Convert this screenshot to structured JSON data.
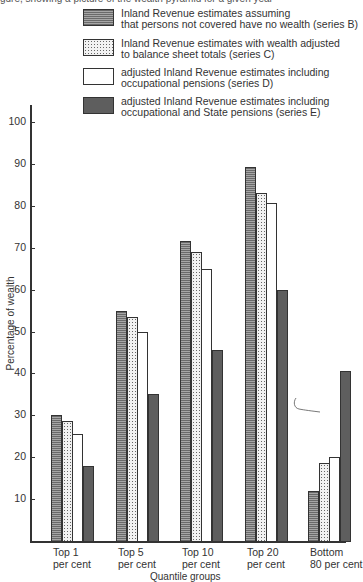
{
  "page": {
    "cut_caption": "gure, showing a picture of the wealth pyramid for a given year"
  },
  "chart_data": {
    "type": "bar",
    "title": "",
    "xlabel": "Quantile groups",
    "ylabel": "Percentage of wealth",
    "ylim": [
      0,
      100
    ],
    "yticks": [
      10,
      20,
      30,
      40,
      50,
      60,
      70,
      80,
      90,
      100
    ],
    "grid": false,
    "legend_position": "top-right",
    "categories": [
      "Top 1 per cent",
      "Top 5 per cent",
      "Top 10 per cent",
      "Top 20 per cent",
      "Bottom 80 per cent"
    ],
    "category_labels": [
      {
        "line1": "Top 1",
        "line2": "per cent"
      },
      {
        "line1": "Top 5",
        "line2": "per cent"
      },
      {
        "line1": "Top 10",
        "line2": "per cent"
      },
      {
        "line1": "Top 20",
        "line2": "per cent"
      },
      {
        "line1": "Bottom",
        "line2": "80 per cent"
      }
    ],
    "series": [
      {
        "name": "Inland Revenue estimates assuming that persons not covered have no wealth (series B)",
        "legend_line1": "Inland Revenue estimates assuming",
        "legend_line2": "that persons not covered have no wealth (series B)",
        "pattern": "horizontal-hatch",
        "values": [
          30,
          55,
          71.5,
          89.3,
          12
        ]
      },
      {
        "name": "Inland Revenue estimates with wealth adjusted to balance sheet totals (series C)",
        "legend_line1": "Inland Revenue estimates with wealth adjusted",
        "legend_line2": "to balance sheet totals (series C)",
        "pattern": "dotted",
        "values": [
          28.7,
          53.5,
          69,
          83,
          18.7
        ]
      },
      {
        "name": "adjusted Inland Revenue estimates including occupational pensions (series D)",
        "legend_line1": "adjusted Inland Revenue estimates including",
        "legend_line2": "occupational pensions (series D)",
        "pattern": "white",
        "values": [
          25.5,
          50,
          65,
          80.7,
          20
        ]
      },
      {
        "name": "adjusted Inland Revenue estimates including occupational and State pensions (series E)",
        "legend_line1": "adjusted Inland Revenue estimates including",
        "legend_line2": "occupational and State pensions (series E)",
        "pattern": "dark-solid",
        "values": [
          18,
          35,
          45.5,
          60,
          40.5
        ]
      }
    ]
  }
}
